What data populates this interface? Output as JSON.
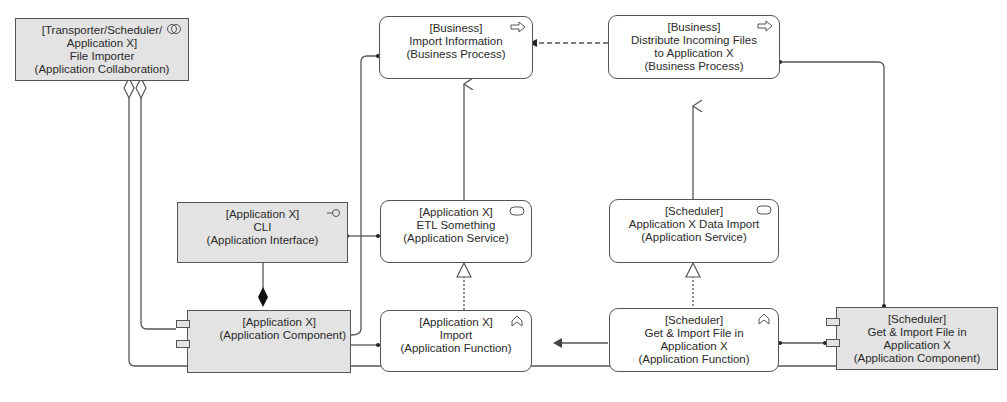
{
  "diagram": {
    "type": "ArchiMate",
    "nodes": {
      "file_importer": {
        "lines": [
          "[Transporter/Scheduler/",
          "Application X]",
          "File Importer",
          "(Application Collaboration)"
        ],
        "icon": "collaboration-icon"
      },
      "import_information": {
        "lines": [
          "[Business]",
          "Import Information",
          "(Business Process)"
        ],
        "icon": "process-arrow-icon"
      },
      "distribute_files": {
        "lines": [
          "[Business]",
          "Distribute Incoming Files",
          "to Application X",
          "(Business Process)"
        ],
        "icon": "process-arrow-icon"
      },
      "cli": {
        "lines": [
          "[Application X]",
          "CLI",
          "(Application Interface)"
        ],
        "icon": "interface-lollipop-icon"
      },
      "etl_something": {
        "lines": [
          "[Application X]",
          "ETL Something",
          "(Application Service)"
        ],
        "icon": "service-pill-icon"
      },
      "data_import_service": {
        "lines": [
          "[Scheduler]",
          "Application X Data Import",
          "(Application Service)"
        ],
        "icon": "service-pill-icon"
      },
      "app_x_component": {
        "lines": [
          "[Application X]",
          "(Application Component)"
        ],
        "icon": "component-icon"
      },
      "import_function": {
        "lines": [
          "[Application X]",
          "Import",
          "(Application Function)"
        ],
        "icon": "function-chevron-icon"
      },
      "get_import_function": {
        "lines": [
          "[Scheduler]",
          "Get & Import File in",
          "Application X",
          "(Application Function)"
        ],
        "icon": "function-chevron-icon"
      },
      "scheduler_component": {
        "lines": [
          "[Scheduler]",
          "Get & Import File in",
          "Application X",
          "(Application Component)"
        ],
        "icon": "component-icon"
      }
    },
    "relations": [
      {
        "from": "file_importer",
        "to": "app_x_component",
        "type": "aggregation"
      },
      {
        "from": "file_importer",
        "to": "scheduler_component",
        "type": "aggregation"
      },
      {
        "from": "app_x_component",
        "to": "cli",
        "type": "composition"
      },
      {
        "from": "app_x_component",
        "to": "import_information",
        "type": "assignment"
      },
      {
        "from": "cli",
        "to": "etl_something",
        "type": "assignment"
      },
      {
        "from": "etl_something",
        "to": "import_information",
        "type": "serving"
      },
      {
        "from": "import_function",
        "to": "etl_something",
        "type": "realization"
      },
      {
        "from": "app_x_component",
        "to": "import_function",
        "type": "assignment"
      },
      {
        "from": "get_import_function",
        "to": "import_function",
        "type": "triggering"
      },
      {
        "from": "get_import_function",
        "to": "data_import_service",
        "type": "realization"
      },
      {
        "from": "data_import_service",
        "to": "distribute_files",
        "type": "serving"
      },
      {
        "from": "distribute_files",
        "to": "import_information",
        "type": "flow"
      },
      {
        "from": "scheduler_component",
        "to": "distribute_files",
        "type": "assignment"
      },
      {
        "from": "scheduler_component",
        "to": "get_import_function",
        "type": "assignment"
      }
    ],
    "colors": {
      "grey_fill": "#e3e3e3",
      "white_fill": "#ffffff",
      "line": "#555555"
    }
  }
}
